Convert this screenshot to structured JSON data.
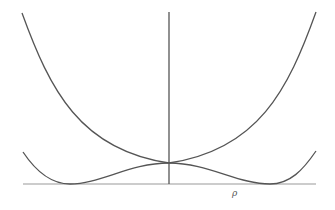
{
  "diagram": {
    "type": "potential-curves",
    "axis_label_x": "ρ",
    "colors": {
      "background": "#ffffff",
      "curve": "#555555",
      "axis": "#888888",
      "vertical_axis": "#555555"
    },
    "curves": [
      {
        "name": "single-well",
        "description": "upward quartic-like curve with minimum at origin"
      },
      {
        "name": "double-well",
        "description": "Mexican-hat profile with local maximum at origin and two minima on the axis"
      }
    ]
  }
}
